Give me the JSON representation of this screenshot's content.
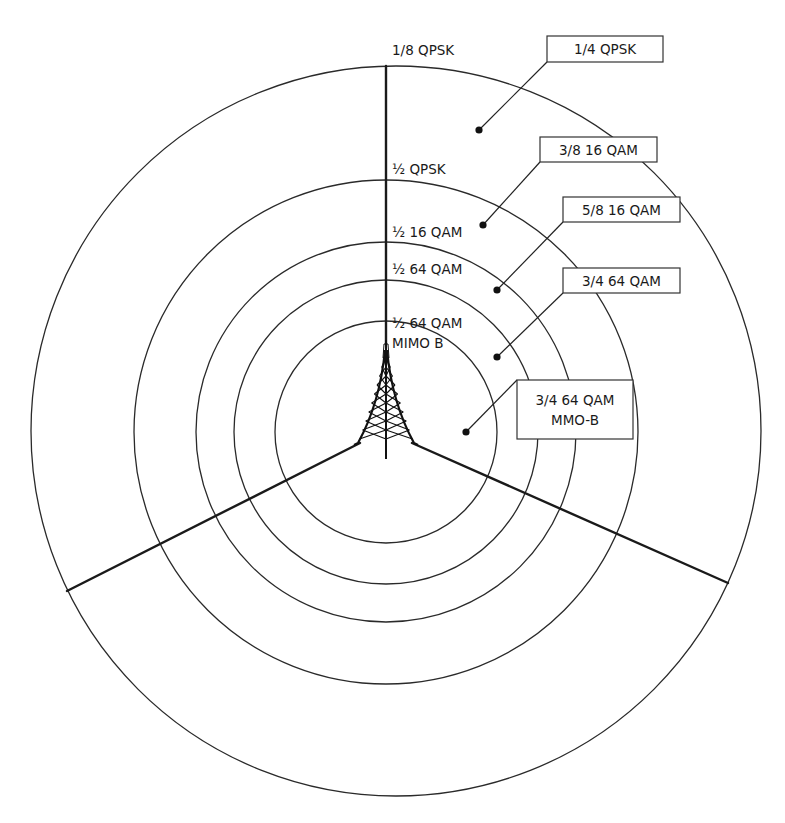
{
  "figure": {
    "type": "coverage-ring-diagram",
    "colors": {
      "line": "#1a1a1a",
      "background": "#ffffff",
      "box_fill": "#ffffff"
    },
    "center": {
      "x": 386,
      "y": 432
    },
    "rings": [
      {
        "id": "ring-outer",
        "cx": 396,
        "cy": 431,
        "r": 365
      },
      {
        "id": "ring-2",
        "cx": 386,
        "cy": 432,
        "r": 252
      },
      {
        "id": "ring-3",
        "cx": 386,
        "cy": 432,
        "r": 190
      },
      {
        "id": "ring-4",
        "cx": 386,
        "cy": 432,
        "r": 152
      },
      {
        "id": "ring-inner",
        "cx": 386,
        "cy": 432,
        "r": 111
      }
    ],
    "sector_lines": [
      {
        "id": "sector-line-north",
        "x1": 386,
        "y1": 344,
        "x2": 386,
        "y2": 66
      },
      {
        "id": "sector-line-southwest",
        "x1": 360,
        "y1": 443,
        "x2": 67,
        "y2": 591
      },
      {
        "id": "sector-line-southeast",
        "x1": 412,
        "y1": 443,
        "x2": 728,
        "y2": 583
      }
    ],
    "axis_labels": [
      {
        "id": "label-1-8-qpsk",
        "text": "1/8 QPSK",
        "x": 392,
        "y": 55
      },
      {
        "id": "label-half-qpsk",
        "text": "½ QPSK",
        "x": 392,
        "y": 174
      },
      {
        "id": "label-half-16qam",
        "text": "½ 16 QAM",
        "x": 392,
        "y": 237
      },
      {
        "id": "label-half-64qam",
        "text": "½ 64 QAM",
        "x": 392,
        "y": 274
      },
      {
        "id": "label-half-64qam-mimo-line1",
        "text": "½ 64 QAM",
        "x": 392,
        "y": 328
      },
      {
        "id": "label-half-64qam-mimo-line2",
        "text": "MIMO B",
        "x": 392,
        "y": 348
      }
    ],
    "callouts": [
      {
        "id": "callout-1-4-qpsk",
        "lines": [
          "1/4 QPSK"
        ],
        "box": {
          "x": 547,
          "y": 36,
          "w": 116,
          "h": 26
        },
        "dot": {
          "x": 479,
          "y": 130
        },
        "anchor": {
          "x": 547,
          "y": 62
        }
      },
      {
        "id": "callout-3-8-16qam",
        "lines": [
          "3/8 16 QAM"
        ],
        "box": {
          "x": 540,
          "y": 137,
          "w": 117,
          "h": 25
        },
        "dot": {
          "x": 483,
          "y": 225
        },
        "anchor": {
          "x": 540,
          "y": 162
        }
      },
      {
        "id": "callout-5-8-16qam",
        "lines": [
          "5/8 16 QAM"
        ],
        "box": {
          "x": 563,
          "y": 197,
          "w": 117,
          "h": 25
        },
        "dot": {
          "x": 497,
          "y": 290
        },
        "anchor": {
          "x": 563,
          "y": 222
        }
      },
      {
        "id": "callout-3-4-64qam",
        "lines": [
          "3/4 64 QAM"
        ],
        "box": {
          "x": 563,
          "y": 268,
          "w": 117,
          "h": 25
        },
        "dot": {
          "x": 497,
          "y": 357
        },
        "anchor": {
          "x": 563,
          "y": 293
        }
      },
      {
        "id": "callout-3-4-64qam-mmo-b",
        "lines": [
          "3/4 64 QAM",
          "MMO-B"
        ],
        "box": {
          "x": 517,
          "y": 380,
          "w": 116,
          "h": 59
        },
        "dot": {
          "x": 466,
          "y": 432
        },
        "anchor": {
          "x": 517,
          "y": 380
        }
      }
    ],
    "tower": {
      "apex_x": 386,
      "apex_y": 344,
      "base_y": 443,
      "base_left_x": 358,
      "base_right_x": 414,
      "mast_bottom_y": 459
    }
  }
}
